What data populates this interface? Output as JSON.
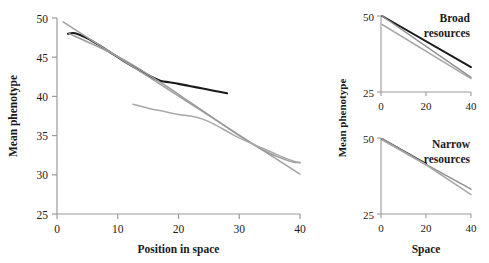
{
  "figure": {
    "background_color": "#ffffff",
    "series_colors": {
      "black": "#1a1a1a",
      "gray_dark": "#8c8c8c",
      "gray_light": "#a8a8a8",
      "axis": "#9a9a9a"
    }
  },
  "chart_data": [
    {
      "id": "main-panel",
      "type": "line",
      "title": "",
      "xlabel": "Position in space",
      "ylabel": "Mean phenotype",
      "xlim": [
        0,
        40
      ],
      "ylim": [
        25,
        50
      ],
      "xticks": [
        0,
        10,
        20,
        30,
        40
      ],
      "xticklabels": [
        "0",
        "10",
        "20",
        "30",
        "40"
      ],
      "yticks": [
        25,
        30,
        35,
        40,
        45,
        50
      ],
      "yticklabels": [
        "25",
        "30",
        "35",
        "40",
        "45",
        "50"
      ],
      "grid": false,
      "legend": "none",
      "series": [
        {
          "name": "black-curve",
          "color": "#1a1a1a",
          "width": 2.1,
          "x": [
            1.8,
            3.0,
            5.0,
            7.0,
            9.0,
            11.0,
            13.0,
            15.0,
            17.0,
            18.5,
            20.0,
            22.0,
            24.0,
            26.0,
            28.0
          ],
          "y": [
            48.0,
            48.05,
            47.4,
            46.5,
            45.5,
            44.5,
            43.6,
            42.7,
            42.0,
            41.8,
            41.6,
            41.3,
            41.0,
            40.7,
            40.4
          ]
        },
        {
          "name": "gray-straight-line",
          "color": "#a0a0a0",
          "width": 1.5,
          "x": [
            1.0,
            40.0
          ],
          "y": [
            49.5,
            30.1
          ]
        },
        {
          "name": "gray-curve-long",
          "color": "#9a9a9a",
          "width": 1.5,
          "x": [
            2.0,
            6.0,
            10.0,
            14.0,
            18.0,
            22.0,
            26.0,
            30.0,
            34.0,
            37.0,
            39.0,
            40.0
          ],
          "y": [
            48.0,
            46.6,
            45.1,
            43.3,
            41.3,
            39.2,
            37.1,
            35.0,
            33.1,
            32.1,
            31.6,
            31.6
          ]
        },
        {
          "name": "gray-curve-short",
          "color": "#a8a8a8",
          "width": 1.5,
          "x": [
            12.5,
            15.0,
            17.5,
            20.0,
            22.0,
            24.0,
            26.0,
            29.0,
            32.0,
            35.0,
            38.0,
            40.0
          ],
          "y": [
            39.0,
            38.5,
            38.1,
            37.7,
            37.5,
            37.1,
            36.4,
            35.1,
            34.0,
            33.0,
            32.0,
            31.5
          ]
        }
      ]
    },
    {
      "id": "broad-resources-panel",
      "type": "line",
      "title": "Broad resources",
      "title_lines": [
        "Broad",
        "resources"
      ],
      "xlabel": "",
      "ylabel": "Mean phenotype",
      "xlim": [
        0,
        40
      ],
      "ylim": [
        25,
        50
      ],
      "xticks": [
        0,
        20,
        40
      ],
      "xticklabels": [
        "0",
        "20",
        "40"
      ],
      "yticks": [
        25,
        50
      ],
      "yticklabels": [
        "25",
        "50"
      ],
      "grid": false,
      "legend": "none",
      "series": [
        {
          "name": "black-line",
          "color": "#1a1a1a",
          "width": 2.0,
          "x": [
            0.5,
            40.0
          ],
          "y": [
            50.0,
            33.2
          ]
        },
        {
          "name": "gray-line-upper",
          "color": "#8f8f8f",
          "width": 1.5,
          "x": [
            0.5,
            40.0
          ],
          "y": [
            50.0,
            29.8
          ]
        },
        {
          "name": "gray-line-lower",
          "color": "#a8a8a8",
          "width": 1.5,
          "x": [
            0.5,
            40.0
          ],
          "y": [
            47.2,
            29.4
          ]
        }
      ]
    },
    {
      "id": "narrow-resources-panel",
      "type": "line",
      "title": "Narrow resources",
      "title_lines": [
        "Narrow",
        "resources"
      ],
      "xlabel": "Space",
      "ylabel": "Mean phenotype",
      "xlim": [
        0,
        40
      ],
      "ylim": [
        25,
        50
      ],
      "xticks": [
        0,
        20,
        40
      ],
      "xticklabels": [
        "0",
        "20",
        "40"
      ],
      "yticks": [
        25,
        50
      ],
      "yticklabels": [
        "25",
        "50"
      ],
      "grid": false,
      "legend": "none",
      "series": [
        {
          "name": "black-line",
          "color": "#1a1a1a",
          "width": 2.0,
          "x": [
            0.5,
            20.0
          ],
          "y": [
            49.6,
            41.5
          ]
        },
        {
          "name": "gray-line-upper",
          "color": "#8f8f8f",
          "width": 1.5,
          "x": [
            0.5,
            20.0,
            40.0
          ],
          "y": [
            49.8,
            41.3,
            33.2
          ]
        },
        {
          "name": "gray-line-lower",
          "color": "#a8a8a8",
          "width": 1.5,
          "x": [
            0.5,
            20.0,
            40.0
          ],
          "y": [
            49.4,
            41.2,
            31.4
          ]
        }
      ]
    }
  ],
  "labels": {
    "main_xlabel": "Position in space",
    "main_ylabel": "Mean phenotype",
    "right_ylabel": "Mean phenotype",
    "right_xlabel": "Space",
    "broad_line1": "Broad",
    "broad_line2": "resources",
    "narrow_line1": "Narrow",
    "narrow_line2": "resources",
    "main_ytick_50": "50",
    "main_ytick_45": "45",
    "main_ytick_40": "40",
    "main_ytick_35": "35",
    "main_ytick_30": "30",
    "main_ytick_25": "25",
    "main_xtick_0": "0",
    "main_xtick_10": "10",
    "main_xtick_20": "20",
    "main_xtick_30": "30",
    "main_xtick_40": "40",
    "broad_ytick_50": "50",
    "broad_ytick_25": "25",
    "broad_xtick_0": "0",
    "broad_xtick_20": "20",
    "broad_xtick_40": "40",
    "narrow_ytick_50": "50",
    "narrow_ytick_25": "25",
    "narrow_xtick_0": "0",
    "narrow_xtick_20": "20",
    "narrow_xtick_40": "40"
  }
}
